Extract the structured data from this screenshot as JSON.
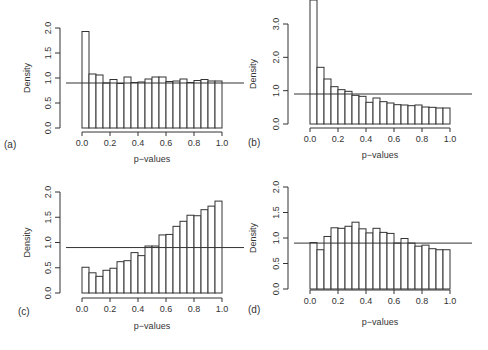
{
  "figure": {
    "panels": [
      {
        "id": "a",
        "label": "(a)",
        "ylabel": "Density",
        "xlabel": "p−values"
      },
      {
        "id": "b",
        "label": "(b)",
        "ylabel": "Density",
        "xlabel": "p−values"
      },
      {
        "id": "c",
        "label": "(c)",
        "ylabel": "Density",
        "xlabel": "p−values"
      },
      {
        "id": "d",
        "label": "(d)",
        "ylabel": "Density",
        "xlabel": "p−values"
      }
    ]
  },
  "chart_data": [
    {
      "type": "bar",
      "panel": "(a)",
      "title": "",
      "xlabel": "p−values",
      "ylabel": "Density",
      "xlim": [
        0,
        1
      ],
      "ylim": [
        0,
        2.0
      ],
      "xticks": [
        "0.0",
        "0.2",
        "0.4",
        "0.6",
        "0.8",
        "1.0"
      ],
      "yticks": [
        "0.0",
        "0.5",
        "1.0",
        "1.5",
        "2.0"
      ],
      "bin_width": 0.05,
      "values": [
        1.93,
        1.08,
        1.06,
        0.9,
        0.97,
        0.89,
        1.02,
        0.91,
        0.92,
        0.98,
        1.02,
        1.02,
        0.93,
        0.94,
        0.98,
        0.91,
        0.95,
        0.97,
        0.94,
        0.94
      ],
      "reference_line": 0.9,
      "grid": false
    },
    {
      "type": "bar",
      "panel": "(b)",
      "title": "",
      "xlabel": "p−values",
      "ylabel": "Density",
      "xlim": [
        0,
        1
      ],
      "ylim": [
        0,
        3.0
      ],
      "xticks": [
        "0.0",
        "0.2",
        "0.4",
        "0.6",
        "0.8",
        "1.0"
      ],
      "yticks": [
        "0.0",
        "1.0",
        "2.0",
        "3.0"
      ],
      "bin_width": 0.05,
      "values": [
        6.0,
        1.7,
        1.35,
        1.12,
        1.03,
        0.98,
        0.86,
        0.83,
        0.65,
        0.78,
        0.67,
        0.63,
        0.58,
        0.57,
        0.55,
        0.57,
        0.51,
        0.5,
        0.48,
        0.48
      ],
      "note": "first bar exceeds plot range (clipped)",
      "reference_line": 0.9,
      "grid": false
    },
    {
      "type": "bar",
      "panel": "(c)",
      "title": "",
      "xlabel": "p−values",
      "ylabel": "Density",
      "xlim": [
        0,
        1
      ],
      "ylim": [
        0,
        2.0
      ],
      "xticks": [
        "0.0",
        "0.2",
        "0.4",
        "0.6",
        "0.8",
        "1.0"
      ],
      "yticks": [
        "0.0",
        "0.5",
        "1.0",
        "1.5",
        "2.0"
      ],
      "bin_width": 0.05,
      "values": [
        0.51,
        0.4,
        0.33,
        0.45,
        0.49,
        0.62,
        0.64,
        0.8,
        0.74,
        0.93,
        0.93,
        1.15,
        1.16,
        1.32,
        1.42,
        1.54,
        1.53,
        1.65,
        1.72,
        1.82
      ],
      "reference_line": 0.9,
      "grid": false
    },
    {
      "type": "bar",
      "panel": "(d)",
      "title": "",
      "xlabel": "p−values",
      "ylabel": "Density",
      "xlim": [
        0,
        1
      ],
      "ylim": [
        0,
        2.0
      ],
      "xticks": [
        "0.0",
        "0.2",
        "0.4",
        "0.6",
        "0.8",
        "1.0"
      ],
      "yticks": [
        "0.0",
        "0.5",
        "1.0",
        "1.5",
        "2.0"
      ],
      "bin_width": 0.05,
      "values": [
        0.91,
        0.77,
        1.03,
        1.2,
        1.19,
        1.23,
        1.31,
        1.18,
        1.1,
        1.19,
        1.11,
        1.09,
        0.9,
        0.99,
        0.9,
        0.84,
        0.86,
        0.79,
        0.77,
        0.77
      ],
      "reference_line": 0.9,
      "grid": false
    }
  ]
}
